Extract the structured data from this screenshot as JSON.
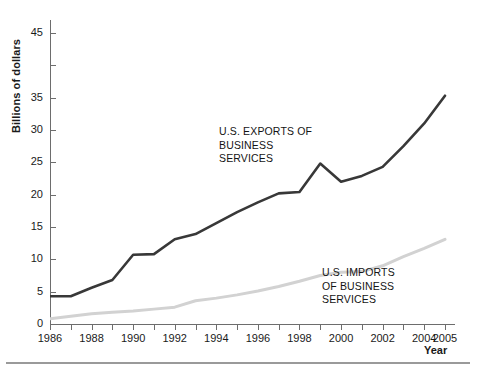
{
  "figure": {
    "background_color": "#ffffff",
    "rule_color": "#9a9a9a"
  },
  "axes": {
    "y_title": "Billions of dollars",
    "x_title": "Year",
    "y_tick_labels": [
      "0",
      "5",
      "10",
      "15",
      "20",
      "25",
      "30",
      "35",
      "",
      "45"
    ],
    "y_tick_values": [
      0,
      5,
      10,
      15,
      20,
      25,
      30,
      35,
      40,
      45
    ],
    "x_tick_labels": [
      "1986",
      "1988",
      "1990",
      "1992",
      "1994",
      "1996",
      "1998",
      "2000",
      "2002",
      "2004",
      "2005"
    ],
    "x_tick_values": [
      1986,
      1988,
      1990,
      1992,
      1994,
      1996,
      1998,
      2000,
      2002,
      2004,
      2005
    ],
    "axis_color": "#6d6d6d"
  },
  "annotations": {
    "exports_label": "U.S. EXPORTS OF\nBUSINESS\nSERVICES",
    "imports_label": "U.S. IMPORTS\nOF BUSINESS\nSERVICES"
  },
  "chart_data": {
    "type": "line",
    "title": "",
    "subtitle": "",
    "xlabel": "Year",
    "ylabel": "Billions of dollars",
    "xlim": [
      1986,
      2005
    ],
    "ylim": [
      0,
      47
    ],
    "grid": false,
    "legend": "inline-annotations",
    "x": [
      1986,
      1987,
      1988,
      1989,
      1990,
      1991,
      1992,
      1993,
      1994,
      1995,
      1996,
      1997,
      1998,
      1999,
      2000,
      2001,
      2002,
      2003,
      2004,
      2005
    ],
    "series": [
      {
        "name": "U.S. EXPORTS OF BUSINESS SERVICES",
        "color": "#383838",
        "width": 2.6,
        "values": [
          4.3,
          4.3,
          5.6,
          6.8,
          10.7,
          10.8,
          13.1,
          13.9,
          15.6,
          17.3,
          18.8,
          20.2,
          20.4,
          24.8,
          22.0,
          22.9,
          24.3,
          27.5,
          31.0,
          35.3
        ]
      },
      {
        "name": "U.S. IMPORTS OF BUSINESS SERVICES",
        "color": "#d2d2d2",
        "width": 3.0,
        "values": [
          0.8,
          1.2,
          1.6,
          1.8,
          2.0,
          2.3,
          2.6,
          3.6,
          4.0,
          4.5,
          5.1,
          5.8,
          6.6,
          7.5,
          8.0,
          8.1,
          9.0,
          10.4,
          11.7,
          13.1
        ]
      }
    ]
  }
}
